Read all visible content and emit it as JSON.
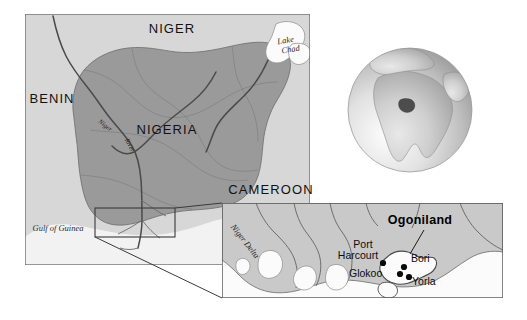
{
  "figure": {
    "colors": {
      "nigeria_fill": "#9a9a9a",
      "neighbour_land": "#d7d7d7",
      "water": "#f2f2f2",
      "highlight_white": "#fbfbfb",
      "frame": "#6f6f6f",
      "river": "#4a4a4a",
      "dot": "#0a0a0a"
    }
  },
  "main_map": {
    "name": "nigeria-overview-map",
    "countries": [
      {
        "id": "niger",
        "label": "NIGER",
        "x": 172,
        "y": 33
      },
      {
        "id": "benin",
        "label": "BENIN",
        "x": 52,
        "y": 103
      },
      {
        "id": "nigeria",
        "label": "NIGERIA",
        "x": 167,
        "y": 134
      },
      {
        "id": "cameroon",
        "label": "CAMEROON",
        "x": 271,
        "y": 194
      }
    ],
    "water_labels": [
      {
        "id": "lake-chad",
        "label": "Lake",
        "label2": "Chad",
        "x": 286,
        "y": 43
      },
      {
        "id": "gulf-of-guinea",
        "label": "Gulf of Guinea",
        "x": 58,
        "y": 231
      }
    ],
    "river_labels": [
      {
        "id": "niger-river-label",
        "label": "Niger",
        "x": 104,
        "y": 127,
        "rotate": 38
      },
      {
        "id": "benue-river-label",
        "label": "River",
        "x": 128,
        "y": 146,
        "rotate": 62
      }
    ]
  },
  "globe": {
    "name": "globe-locator",
    "highlight_region": "Nigeria",
    "center_x": 410,
    "center_y": 110,
    "radius": 62
  },
  "inset_map": {
    "name": "ogoniland-inset-map",
    "region_label": "Ogoniland",
    "region_label_x": 420,
    "region_label_y": 224,
    "delta_label": "Niger Delta",
    "delta_label_x": 243,
    "delta_label_y": 243,
    "places": [
      {
        "id": "port-harcourt",
        "label": "Port",
        "label2": "Harcourt",
        "label_x": 363,
        "label_y": 248,
        "dot_x": 383,
        "dot_y": 263
      },
      {
        "id": "bori",
        "label": "Bori",
        "label_x": 411,
        "label_y": 262,
        "dot_x": 404,
        "dot_y": 267
      },
      {
        "id": "glokoo",
        "label": "Glokoo",
        "label_x": 349,
        "label_y": 277,
        "dot_x": 400,
        "dot_y": 274
      },
      {
        "id": "yorla",
        "label": "Yorla",
        "label_x": 412,
        "label_y": 285,
        "dot_x": 409,
        "dot_y": 277
      }
    ]
  }
}
